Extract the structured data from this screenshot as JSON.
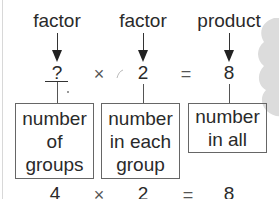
{
  "diagram": {
    "top_labels": [
      "factor",
      "factor",
      "product"
    ],
    "equation": {
      "factor1": "?",
      "times": "×",
      "factor2": "2",
      "equals": "=",
      "product": "8"
    },
    "boxes": [
      {
        "lines": [
          "number",
          "of",
          "groups"
        ]
      },
      {
        "lines": [
          "number",
          "in each",
          "group"
        ]
      },
      {
        "lines": [
          "number",
          "in all"
        ]
      }
    ],
    "solution": {
      "factor1": "4",
      "times": "×",
      "factor2": "2",
      "equals": "=",
      "product": "8"
    },
    "colors": {
      "text": "#2a2a2a",
      "lines": "#555555",
      "decoration": "#d9d9d9"
    }
  }
}
